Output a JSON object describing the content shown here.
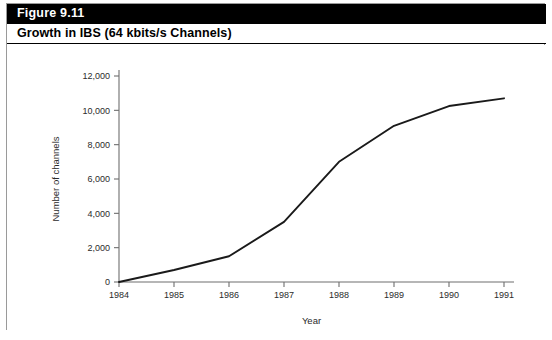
{
  "figure": {
    "number": "Figure 9.11",
    "title": "Growth in IBS (64 kbits/s Channels)"
  },
  "colors": {
    "header_band": "#000000",
    "header_text": "#ffffff",
    "title_text": "#000000",
    "card_border": "#9a9a9a",
    "axis": "#6e6e6e",
    "line": "#1a1a1a",
    "tick_text": "#2b2b2b"
  },
  "chart_data": {
    "type": "line",
    "title": "Growth in IBS (64 kbits/s Channels)",
    "xlabel": "Year",
    "ylabel": "Number of channels",
    "x": [
      1984,
      1985,
      1986,
      1987,
      1988,
      1989,
      1990,
      1991
    ],
    "xtick_labels": [
      "1984",
      "1985",
      "1986",
      "1987",
      "1988",
      "1989",
      "1990",
      "1991"
    ],
    "ytick_values": [
      0,
      2000,
      4000,
      6000,
      8000,
      10000,
      12000
    ],
    "ytick_labels": [
      "0",
      "2,000",
      "4,000",
      "6,000",
      "8,000",
      "10,000",
      "12,000"
    ],
    "xlim": [
      1984,
      1991
    ],
    "ylim": [
      0,
      12000
    ],
    "grid": false,
    "legend": false,
    "series": [
      {
        "name": "Number of channels",
        "values": [
          0,
          700,
          1500,
          3500,
          7000,
          9100,
          10250,
          10700
        ]
      }
    ]
  }
}
